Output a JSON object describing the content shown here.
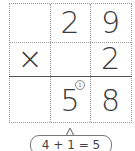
{
  "problem": {
    "row1": [
      "",
      "2",
      "9"
    ],
    "row2": [
      "×",
      "",
      "2"
    ],
    "result": [
      "",
      "5",
      "8"
    ],
    "carry": "1",
    "carry_display": "①"
  },
  "callout": {
    "text": "4 + 1 = 5"
  },
  "colors": {
    "grid_line": "#9a9a9a",
    "result_line": "#555555",
    "text": "#3a3a3a"
  }
}
